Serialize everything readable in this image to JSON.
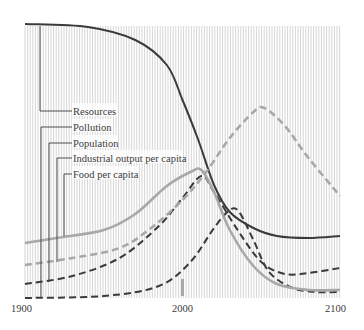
{
  "chart_data": {
    "type": "line",
    "title": "",
    "xlabel": "",
    "ylabel": "",
    "x_ticks": [
      "1900",
      "2000",
      "2100"
    ],
    "xlim": [
      1900,
      2100
    ],
    "grid": "dense vertical hatching",
    "legend_position": "leader-line labels, upper left",
    "annotations": [
      "grey marker near 1970 (present)"
    ],
    "series": [
      {
        "name": "Resources",
        "style": "solid",
        "color": "#3a3a3a",
        "points": [
          [
            1900,
            24
          ],
          [
            1940,
            27
          ],
          [
            1970,
            40
          ],
          [
            1990,
            65
          ],
          [
            2000,
            100
          ],
          [
            2010,
            140
          ],
          [
            2020,
            185
          ],
          [
            2030,
            212
          ],
          [
            2045,
            228
          ],
          [
            2060,
            236
          ],
          [
            2080,
            238
          ],
          [
            2100,
            236
          ]
        ]
      },
      {
        "name": "Pollution",
        "style": "dashed",
        "color": "#3a3a3a",
        "points": [
          [
            1900,
            298
          ],
          [
            1950,
            296
          ],
          [
            1985,
            286
          ],
          [
            2005,
            262
          ],
          [
            2020,
            228
          ],
          [
            2030,
            210
          ],
          [
            2036,
            212
          ],
          [
            2045,
            240
          ],
          [
            2055,
            272
          ],
          [
            2070,
            288
          ],
          [
            2085,
            292
          ],
          [
            2100,
            292
          ]
        ]
      },
      {
        "name": "Population",
        "style": "dashed",
        "color": "#3a3a3a",
        "points": [
          [
            1900,
            284
          ],
          [
            1930,
            276
          ],
          [
            1960,
            258
          ],
          [
            1985,
            226
          ],
          [
            2000,
            198
          ],
          [
            2012,
            176
          ],
          [
            2020,
            192
          ],
          [
            2035,
            230
          ],
          [
            2050,
            262
          ],
          [
            2065,
            274
          ],
          [
            2080,
            273
          ],
          [
            2100,
            268
          ]
        ]
      },
      {
        "name": "Industrial output per capita",
        "style": "dashed",
        "color": "#a8a8a8",
        "points": [
          [
            1900,
            265
          ],
          [
            1930,
            258
          ],
          [
            1960,
            248
          ],
          [
            1980,
            228
          ],
          [
            2000,
            200
          ],
          [
            2015,
            172
          ],
          [
            2030,
            138
          ],
          [
            2045,
            112
          ],
          [
            2052,
            108
          ],
          [
            2065,
            126
          ],
          [
            2080,
            158
          ],
          [
            2100,
            196
          ]
        ]
      },
      {
        "name": "Food per capita",
        "style": "solid",
        "color": "#a8a8a8",
        "points": [
          [
            1900,
            243
          ],
          [
            1920,
            238
          ],
          [
            1950,
            230
          ],
          [
            1970,
            214
          ],
          [
            1990,
            186
          ],
          [
            2005,
            172
          ],
          [
            2012,
            170
          ],
          [
            2020,
            192
          ],
          [
            2030,
            230
          ],
          [
            2045,
            266
          ],
          [
            2060,
            284
          ],
          [
            2080,
            290
          ],
          [
            2100,
            290
          ]
        ]
      }
    ]
  },
  "labels": {
    "resources": "Resources",
    "pollution": "Pollution",
    "population": "Population",
    "industrial": "Industrial output per capita",
    "food": "Food per capita"
  },
  "axis": {
    "x1900": "1900",
    "x2000": "2000",
    "x2100": "2100"
  }
}
